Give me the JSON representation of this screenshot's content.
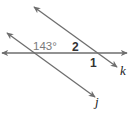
{
  "diagram": {
    "type": "parallel-lines-transversal",
    "colors": {
      "line": "#6e6e6e",
      "text": "#222222",
      "given_angle_text": "#7a7a7a"
    },
    "lines": [
      {
        "name": "k",
        "label": "k",
        "from": [
          34,
          7
        ],
        "to": [
          117,
          67
        ]
      },
      {
        "name": "j",
        "label": "j",
        "from": [
          7,
          33
        ],
        "to": [
          95,
          97
        ]
      },
      {
        "name": "transversal",
        "label": "",
        "from": [
          2,
          53
        ],
        "to": [
          127,
          53
        ]
      }
    ],
    "angles": {
      "given": "143°",
      "angle_2": "2",
      "angle_1": "1"
    },
    "line_labels": {
      "k": "k",
      "j": "j"
    }
  }
}
